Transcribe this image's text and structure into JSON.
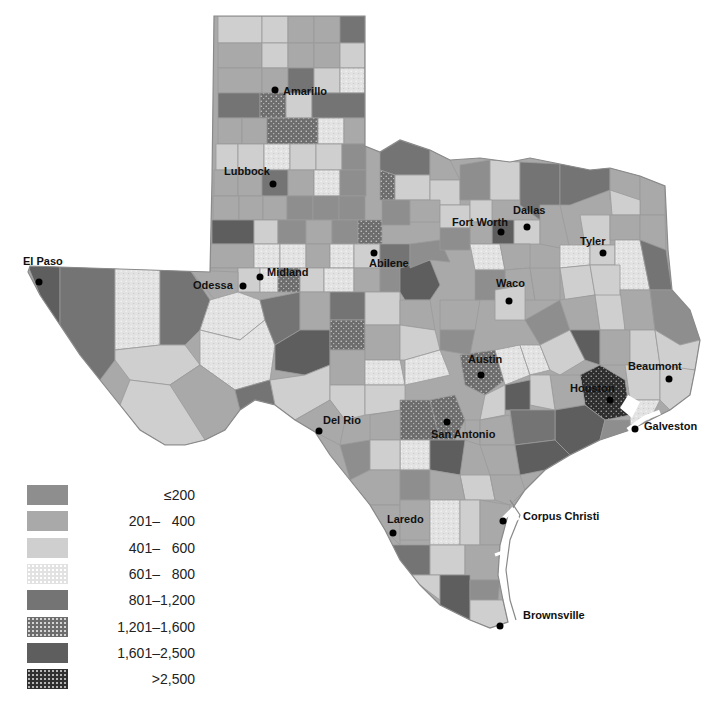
{
  "map": {
    "subject": "Texas counties choropleth",
    "colors": {
      "c1": "#8e8e8e",
      "c2": "#a9a9a9",
      "c3": "#cfcfcf",
      "c4": "#e2e2e2",
      "c5": "#747474",
      "c6": "#6d6d6d",
      "c7": "#5e5e5e",
      "c8": "#303030",
      "water": "#ffffff",
      "border": "#9a9a9a"
    },
    "cities": [
      {
        "name": "Amarillo",
        "x": 275,
        "y": 90
      },
      {
        "name": "Lubbock",
        "x": 273,
        "y": 184
      },
      {
        "name": "Fort Worth",
        "x": 501,
        "y": 232
      },
      {
        "name": "Dallas",
        "x": 527,
        "y": 227
      },
      {
        "name": "Tyler",
        "x": 603,
        "y": 253
      },
      {
        "name": "El Paso",
        "x": 39,
        "y": 282
      },
      {
        "name": "Midland",
        "x": 260,
        "y": 277
      },
      {
        "name": "Odessa",
        "x": 243,
        "y": 286
      },
      {
        "name": "Abilene",
        "x": 374,
        "y": 253
      },
      {
        "name": "Waco",
        "x": 509,
        "y": 301
      },
      {
        "name": "Austin",
        "x": 481,
        "y": 375
      },
      {
        "name": "Beaumont",
        "x": 669,
        "y": 379
      },
      {
        "name": "Houston",
        "x": 610,
        "y": 400
      },
      {
        "name": "San Antonio",
        "x": 447,
        "y": 422
      },
      {
        "name": "Del Rio",
        "x": 319,
        "y": 431
      },
      {
        "name": "Galveston",
        "x": 635,
        "y": 429
      },
      {
        "name": "Corpus Christi",
        "x": 503,
        "y": 521
      },
      {
        "name": "Laredo",
        "x": 393,
        "y": 533
      },
      {
        "name": "Brownsville",
        "x": 500,
        "y": 626
      }
    ]
  },
  "legend": {
    "items": [
      {
        "label": "≤200",
        "color_key": "c1",
        "pattern": "none"
      },
      {
        "label": "201–   400",
        "color_key": "c2",
        "pattern": "none"
      },
      {
        "label": "401–   600",
        "color_key": "c3",
        "pattern": "none"
      },
      {
        "label": "601–   800",
        "color_key": "c4",
        "pattern": "dots-light"
      },
      {
        "label": "801–1,200",
        "color_key": "c5",
        "pattern": "none"
      },
      {
        "label": "1,201–1,600",
        "color_key": "c6",
        "pattern": "dots-white"
      },
      {
        "label": "1,601–2,500",
        "color_key": "c7",
        "pattern": "none"
      },
      {
        "label": ">2,500",
        "color_key": "c8",
        "pattern": "dots-white"
      }
    ]
  }
}
